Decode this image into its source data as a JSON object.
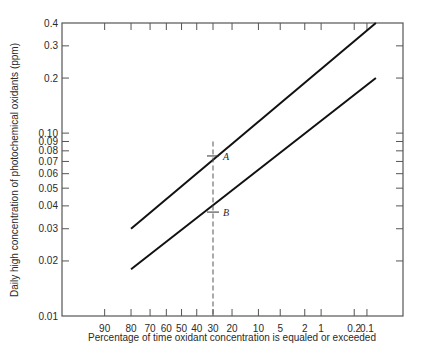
{
  "chart_data": {
    "type": "line",
    "title": "",
    "xlabel": "Percentage of time oxidant concentration is equaled or exceeded",
    "ylabel": "Daily high concentration of photochemical oxidants (ppm)",
    "x_scale": "normal-probability (exceedance %, decreasing to the right)",
    "y_scale": "log",
    "ylim": [
      0.01,
      0.4
    ],
    "xlim_percent": [
      98,
      0.03
    ],
    "x_ticks": [
      90,
      80,
      70,
      60,
      50,
      40,
      30,
      20,
      10,
      5,
      2,
      1,
      0.2,
      0.1
    ],
    "x_tick_labels": [
      "90",
      "80",
      "70",
      "60",
      "50",
      "40",
      "30",
      "20",
      "10",
      "5",
      "2",
      "1",
      "0.2",
      "0.1"
    ],
    "y_ticks": [
      0.01,
      0.02,
      0.03,
      0.04,
      0.05,
      0.06,
      0.07,
      0.08,
      0.09,
      0.1,
      0.2,
      0.3,
      0.4
    ],
    "y_tick_labels": [
      "0.01",
      "0.02",
      "0.03",
      "0.04",
      "0.05",
      "0.06",
      "0.07",
      "0.08",
      "0.09",
      "0.10",
      "0.2",
      "0.3",
      "0.4"
    ],
    "grid": false,
    "series": [
      {
        "name": "upper-line",
        "x": [
          80,
          0.06
        ],
        "y": [
          0.03,
          0.4
        ]
      },
      {
        "name": "lower-line",
        "x": [
          80,
          0.06
        ],
        "y": [
          0.018,
          0.2
        ]
      }
    ],
    "reference_line": {
      "x": 30,
      "y_top": 0.09,
      "style": "dashed"
    },
    "annotations": [
      {
        "label": "A",
        "x": 30,
        "y": 0.075
      },
      {
        "label": "B",
        "x": 30,
        "y": 0.037
      }
    ]
  }
}
